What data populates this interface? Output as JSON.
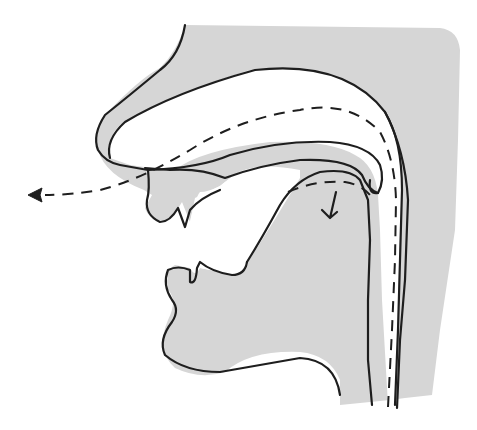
{
  "diagram": {
    "type": "sagittal-section-vocal-tract",
    "colors": {
      "tissue": "#d6d6d6",
      "line": "#1e1e1e",
      "background": "#ffffff"
    },
    "parts": [
      {
        "id": "nose",
        "label": "nose"
      },
      {
        "id": "nasal-cavity",
        "label": "nasal cavity"
      },
      {
        "id": "hard-palate",
        "label": "hard palate"
      },
      {
        "id": "velum",
        "label": "velum (lowered)"
      },
      {
        "id": "upper-lip",
        "label": "upper lip"
      },
      {
        "id": "upper-teeth",
        "label": "upper teeth"
      },
      {
        "id": "lower-lip",
        "label": "lower lip"
      },
      {
        "id": "lower-teeth",
        "label": "lower teeth"
      },
      {
        "id": "tongue",
        "label": "tongue"
      },
      {
        "id": "pharynx",
        "label": "pharynx"
      },
      {
        "id": "chin",
        "label": "chin"
      }
    ],
    "arrows": [
      {
        "id": "nasal-airflow",
        "style": "dashed",
        "direction": "out through nostril"
      },
      {
        "id": "oral-airflow-blocked",
        "style": "dashed",
        "direction": "down into tongue (blocked)"
      }
    ]
  }
}
